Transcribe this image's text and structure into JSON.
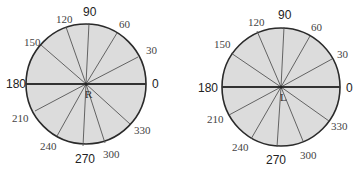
{
  "diagrams": [
    {
      "name": "right-eye",
      "eye_label": "R",
      "center": [
        86,
        84
      ],
      "radius": 60,
      "labels": [
        {
          "text": "0",
          "x": 152,
          "y": 88,
          "font": "sans"
        },
        {
          "text": "30",
          "x": 146,
          "y": 54,
          "font": "serif"
        },
        {
          "text": "60",
          "x": 119,
          "y": 28,
          "font": "serif"
        },
        {
          "text": "90",
          "x": 83,
          "y": 16,
          "font": "sans"
        },
        {
          "text": "120",
          "x": 56,
          "y": 23,
          "font": "serif"
        },
        {
          "text": "150",
          "x": 24,
          "y": 46,
          "font": "serif"
        },
        {
          "text": "180",
          "x": 6,
          "y": 88,
          "font": "sans"
        },
        {
          "text": "210",
          "x": 12,
          "y": 122,
          "font": "serif"
        },
        {
          "text": "240",
          "x": 40,
          "y": 150,
          "font": "serif"
        },
        {
          "text": "270",
          "x": 75,
          "y": 163,
          "font": "sans"
        },
        {
          "text": "300",
          "x": 103,
          "y": 158,
          "font": "serif"
        },
        {
          "text": "330",
          "x": 134,
          "y": 134,
          "font": "serif"
        }
      ],
      "spokes": [
        [
          89,
          23
        ],
        [
          66,
          27
        ],
        [
          117,
          33
        ],
        [
          41,
          45
        ],
        [
          138,
          57
        ],
        [
          35,
          111
        ],
        [
          57,
          136
        ],
        [
          83,
          146
        ],
        [
          105,
          143
        ],
        [
          130,
          124
        ]
      ]
    },
    {
      "name": "left-eye",
      "eye_label": "L",
      "center": [
        281,
        87
      ],
      "radius": 59,
      "labels": [
        {
          "text": "0",
          "x": 346,
          "y": 92,
          "font": "sans"
        },
        {
          "text": "30",
          "x": 337,
          "y": 58,
          "font": "serif"
        },
        {
          "text": "60",
          "x": 311,
          "y": 31,
          "font": "serif"
        },
        {
          "text": "90",
          "x": 278,
          "y": 19,
          "font": "sans"
        },
        {
          "text": "120",
          "x": 248,
          "y": 26,
          "font": "serif"
        },
        {
          "text": "150",
          "x": 214,
          "y": 48,
          "font": "serif"
        },
        {
          "text": "180",
          "x": 198,
          "y": 92,
          "font": "sans"
        },
        {
          "text": "210",
          "x": 207,
          "y": 123,
          "font": "serif"
        },
        {
          "text": "240",
          "x": 232,
          "y": 151,
          "font": "serif"
        },
        {
          "text": "270",
          "x": 266,
          "y": 164,
          "font": "sans"
        },
        {
          "text": "300",
          "x": 300,
          "y": 159,
          "font": "serif"
        },
        {
          "text": "330",
          "x": 331,
          "y": 130,
          "font": "serif"
        }
      ],
      "spokes": [
        [
          284,
          27
        ],
        [
          257,
          31
        ],
        [
          310,
          36
        ],
        [
          231,
          53
        ],
        [
          332,
          59
        ],
        [
          229,
          115
        ],
        [
          251,
          139
        ],
        [
          277,
          147
        ],
        [
          303,
          141
        ],
        [
          329,
          121
        ]
      ]
    }
  ]
}
